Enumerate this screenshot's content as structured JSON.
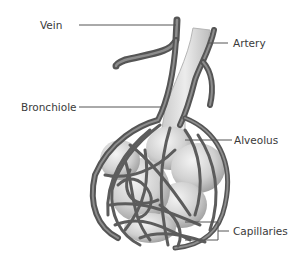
{
  "diagram": {
    "labels": [
      {
        "id": "vein",
        "text": "Vein"
      },
      {
        "id": "artery",
        "text": "Artery"
      },
      {
        "id": "bronchiole",
        "text": "Bronchiole"
      },
      {
        "id": "alveolus",
        "text": "Alveolus"
      },
      {
        "id": "capillaries",
        "text": "Capillaries"
      }
    ],
    "colors": {
      "vessel": "#5a5a5a",
      "vessel_highlight": "#9a9a9a",
      "alveolus": "#d6d6d6",
      "bronchiole": "#dcdcdc",
      "leader_line": "#555555",
      "text": "#3a3a3a",
      "background": "#ffffff"
    }
  }
}
